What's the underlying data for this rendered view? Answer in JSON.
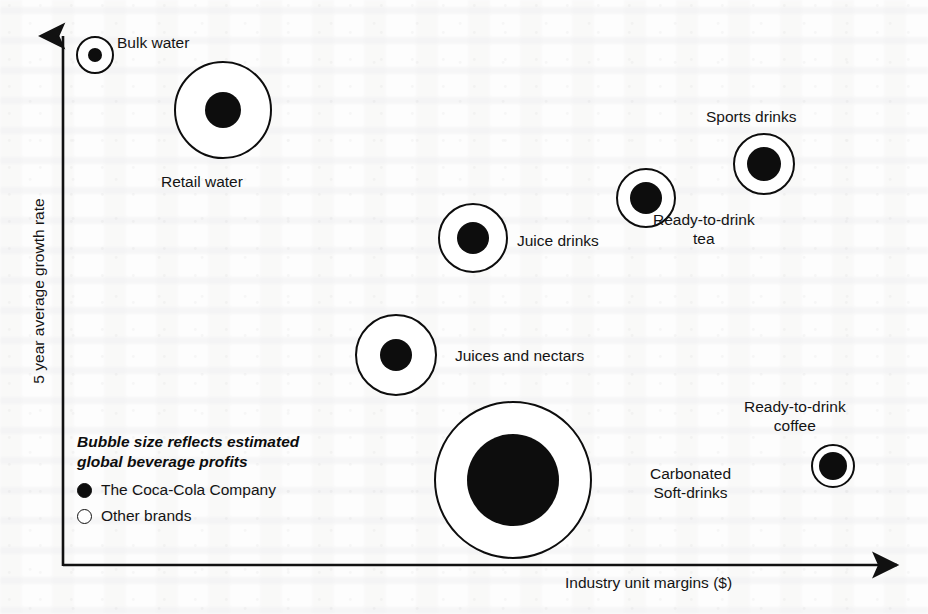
{
  "chart_data": {
    "type": "scatter",
    "title": "",
    "xlabel": "Industry unit margins ($)",
    "ylabel": "5 year average growth rate",
    "axes_style": "arrow",
    "grid": false,
    "legend_position": "bottom-left",
    "size_note": "Bubble size reflects estimated global beverage profits",
    "series": [
      {
        "name": "The Coca-Cola Company",
        "marker": "filled-circle",
        "color": "#0d0d0d"
      },
      {
        "name": "Other brands",
        "marker": "hollow-circle",
        "color": "#ffffff"
      }
    ],
    "points": [
      {
        "label": "Bulk water",
        "cx": 95,
        "cy": 55,
        "outer_r": 18,
        "inner_r": 7,
        "label_x": 117,
        "label_y": 33,
        "align": "left"
      },
      {
        "label": "Retail water",
        "cx": 223,
        "cy": 110,
        "outer_r": 48,
        "inner_r": 18,
        "label_x": 161,
        "label_y": 172,
        "align": "left"
      },
      {
        "label": "Juice drinks",
        "cx": 473,
        "cy": 238,
        "outer_r": 34,
        "inner_r": 16,
        "label_x": 517,
        "label_y": 231,
        "align": "left"
      },
      {
        "label": "Juices and nectars",
        "cx": 396,
        "cy": 355,
        "outer_r": 40,
        "inner_r": 16,
        "label_x": 455,
        "label_y": 346,
        "align": "left"
      },
      {
        "label": "Carbonated\nSoft-drinks",
        "cx": 513,
        "cy": 480,
        "outer_r": 78,
        "inner_r": 46,
        "label_x": 650,
        "label_y": 464,
        "align": "left"
      },
      {
        "label": "Ready-to-drink\ntea",
        "cx": 646,
        "cy": 198,
        "outer_r": 29,
        "inner_r": 16,
        "label_x": 653,
        "label_y": 210,
        "align": "left"
      },
      {
        "label": "Sports drinks",
        "cx": 764,
        "cy": 164,
        "outer_r": 30,
        "inner_r": 17,
        "label_x": 706,
        "label_y": 107,
        "align": "left"
      },
      {
        "label": "Ready-to-drink\ncoffee",
        "cx": 833,
        "cy": 466,
        "outer_r": 21,
        "inner_r": 14,
        "label_x": 744,
        "label_y": 397,
        "align": "left"
      }
    ]
  },
  "axis": {
    "y_label": "5 year average growth rate",
    "x_label": "Industry unit margins ($)"
  },
  "labels": {
    "bulk_water": "Bulk water",
    "retail_water": "Retail water",
    "juice_drinks": "Juice drinks",
    "juices_and_nectars": "Juices and nectars",
    "carbonated_soft_drinks": "Carbonated\nSoft-drinks",
    "ready_to_drink_tea": "Ready-to-drink\ntea",
    "sports_drinks": "Sports drinks",
    "ready_to_drink_coffee": "Ready-to-drink\ncoffee"
  },
  "legend": {
    "title": "Bubble size reflects estimated\nglobal beverage profits",
    "items": [
      {
        "label": "The Coca-Cola Company",
        "marker": "filled"
      },
      {
        "label": "Other brands",
        "marker": "hollow"
      }
    ]
  },
  "colors": {
    "ink": "#0d0d0d",
    "paper": "#fdfdfd",
    "bubble_fill": "#ffffff"
  }
}
